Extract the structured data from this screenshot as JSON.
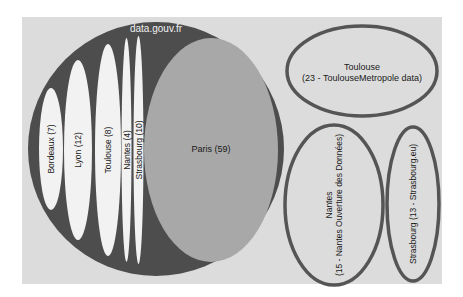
{
  "diagram": {
    "type": "euler-ellipses",
    "colors": {
      "panel": "#dcdcdc",
      "outer_fill": "#4d4d4d",
      "paris_fill": "#a8a8a8",
      "inner_fill": "#f2f2f2",
      "outline": "#555555",
      "label_dark": "#1a1a1a",
      "label_light": "#f0f0f0"
    },
    "outer": {
      "label": "data.gouv.fr"
    },
    "inner": [
      {
        "id": "bordeaux",
        "label": "Bordeaux (7)"
      },
      {
        "id": "lyon",
        "label": "Lyon (12)"
      },
      {
        "id": "toulouse",
        "label": "Toulouse (8)"
      },
      {
        "id": "nantes",
        "label": "Nantes (4)"
      },
      {
        "id": "strasbourg",
        "label": "Strasbourg (10)"
      },
      {
        "id": "paris",
        "label": "Paris (59)"
      }
    ],
    "separate": [
      {
        "id": "toulouse-metropole",
        "line1": "Toulouse",
        "line2": "(23 - ToulouseMetropole data)"
      },
      {
        "id": "nantes-ouverture",
        "line1": "Nantes",
        "line2": "(15 - Nantes Ouverture des Données)"
      },
      {
        "id": "strasbourg-eu",
        "line1": "Strasbourg (13 - Strasbourg.eu)"
      }
    ]
  }
}
